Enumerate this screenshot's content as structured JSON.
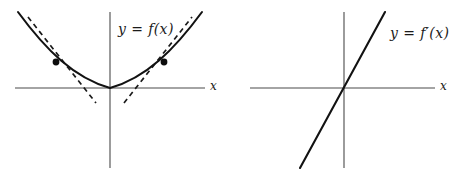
{
  "figure": {
    "panels": [
      {
        "id": "left",
        "curve_label": "y = f(x)",
        "axis_label_x": "x",
        "description": "Upward opening parabola tangent to the x-axis at the origin with two dashed tangent lines and marked points of tangency"
      },
      {
        "id": "right",
        "curve_label": "y = f′(x)",
        "axis_label_x": "x",
        "description": "Straight line of positive slope passing through the origin"
      }
    ]
  },
  "chart_data": [
    {
      "type": "line",
      "id": "left-plot",
      "title": "y = f(x)",
      "xlabel": "x",
      "ylabel": "",
      "xlim": [
        -2.4,
        2.4
      ],
      "ylim": [
        -0.55,
        4.0
      ],
      "grid": false,
      "legend": "none",
      "series": [
        {
          "name": "f(x) = x^2",
          "style": "solid",
          "color": "#121212",
          "x": [
            -2.4,
            -2.1,
            -1.8,
            -1.5,
            -1.2,
            -0.9,
            -0.6,
            -0.3,
            0.0,
            0.3,
            0.6,
            0.9,
            1.2,
            1.5,
            1.8,
            2.1,
            2.4
          ],
          "y": [
            5.76,
            4.41,
            3.24,
            2.25,
            1.44,
            0.81,
            0.36,
            0.09,
            0.0,
            0.09,
            0.36,
            0.81,
            1.44,
            2.25,
            3.24,
            4.41,
            5.76
          ]
        },
        {
          "name": "tangent at x = -1.25",
          "style": "dashed",
          "color": "#1a1a1a",
          "x": [
            -2.05,
            -0.35
          ],
          "y": [
            3.56,
            -0.69
          ]
        },
        {
          "name": "tangent at x = 1.25",
          "style": "dashed",
          "color": "#1a1a1a",
          "x": [
            0.35,
            2.05
          ],
          "y": [
            -0.69,
            3.56
          ]
        }
      ],
      "points": [
        {
          "name": "point of tangency left",
          "x": -1.25,
          "y": 1.5625
        },
        {
          "name": "point of tangency right",
          "x": 1.25,
          "y": 1.5625
        }
      ],
      "annotations": [
        {
          "text": "y = f(x)",
          "x": 0.2,
          "y": 3.5
        }
      ]
    },
    {
      "type": "line",
      "id": "right-plot",
      "title": "y = f′(x)",
      "xlabel": "x",
      "ylabel": "",
      "xlim": [
        -2.4,
        2.4
      ],
      "ylim": [
        -0.55,
        4.0
      ],
      "grid": false,
      "legend": "none",
      "series": [
        {
          "name": "f'(x) = 2x",
          "style": "solid",
          "color": "#121212",
          "x": [
            -1.05,
            0.0,
            1.05
          ],
          "y": [
            -2.1,
            0.0,
            2.1
          ]
        }
      ],
      "points": [],
      "annotations": [
        {
          "text": "y = f′(x)",
          "x": 1.25,
          "y": 3.3
        }
      ]
    }
  ]
}
